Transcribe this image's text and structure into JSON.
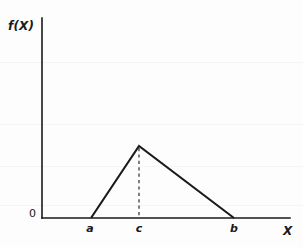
{
  "figure": {
    "width": 303,
    "height": 247,
    "background_color": "#fdfdfd",
    "line_color": "#1a1a1a"
  },
  "labels": {
    "y_axis": "f(X)",
    "x_axis": "X",
    "origin": "0",
    "tick_a": "a",
    "tick_c": "c",
    "tick_b": "b"
  },
  "chart_data": {
    "type": "line",
    "title": "",
    "subtitle": "",
    "xlabel": "X",
    "ylabel": "f(X)",
    "grid": false,
    "legend": "none",
    "xlim": [
      42,
      290
    ],
    "ylim": [
      218,
      18
    ],
    "tick_labels": {
      "x": [
        "a",
        "c",
        "b"
      ],
      "y": [
        "0"
      ]
    },
    "series": [
      {
        "name": "triangular-pdf",
        "style": "solid",
        "points": [
          {
            "label": "a",
            "x": 91,
            "y": 218
          },
          {
            "label": "c",
            "x": 139,
            "y": 146
          },
          {
            "label": "b",
            "x": 234,
            "y": 218
          }
        ]
      },
      {
        "name": "mode-guide",
        "style": "dashed",
        "points": [
          {
            "label": "c-peak",
            "x": 139,
            "y": 146
          },
          {
            "label": "c-axis",
            "x": 139,
            "y": 218
          }
        ]
      }
    ],
    "axes": {
      "y_axis": {
        "x": 42,
        "y_top": 18,
        "y_bottom": 218
      },
      "x_axis": {
        "y": 218,
        "x_left": 42,
        "x_right": 290
      }
    },
    "annotations": [
      {
        "text": "a",
        "x": 89,
        "y": 231,
        "role": "x-tick"
      },
      {
        "text": "c",
        "x": 138,
        "y": 231,
        "role": "x-tick"
      },
      {
        "text": "b",
        "x": 233,
        "y": 231,
        "role": "x-tick"
      },
      {
        "text": "0",
        "x": 33,
        "y": 215,
        "role": "origin"
      },
      {
        "text": "f(X)",
        "x": 22,
        "y": 26,
        "role": "y-axis-title"
      },
      {
        "text": "X",
        "x": 287,
        "y": 232,
        "role": "x-axis-title"
      }
    ]
  }
}
